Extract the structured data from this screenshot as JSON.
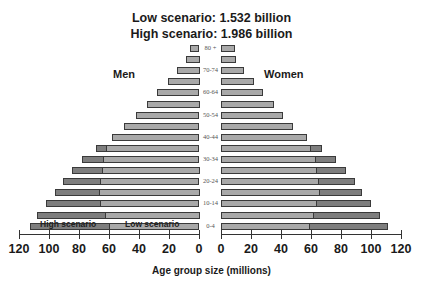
{
  "chart_data": {
    "type": "bar",
    "subtype": "population-pyramid",
    "title": "Low scenario: 1.532 billion",
    "subtitle": "High scenario: 1.986 billion",
    "xlabel": "Age group size (millions)",
    "ylabel": "",
    "left_label": "Men",
    "right_label": "Women",
    "legend": [
      "High scenario",
      "Low scenario"
    ],
    "xlim": [
      0,
      120
    ],
    "x_ticks": [
      0,
      20,
      40,
      60,
      80,
      100,
      120
    ],
    "grid": false,
    "categories": [
      "80 +",
      "75-79",
      "70-74",
      "65-69",
      "60-64",
      "55-59",
      "50-54",
      "45-49",
      "40-44",
      "35-39",
      "30-34",
      "25-29",
      "20-24",
      "15-19",
      "10-14",
      "5-9",
      "0-4"
    ],
    "category_labels_visible": [
      "80 +",
      "",
      "70-74",
      "",
      "60-64",
      "",
      "50-54",
      "",
      "40-44",
      "",
      "30-34",
      "",
      "20-24",
      "",
      "10-14",
      "",
      "0-4"
    ],
    "series": [
      {
        "name": "Men - Low scenario",
        "values": [
          6,
          9,
          15,
          21,
          28,
          35,
          42,
          50,
          58,
          62,
          64,
          65,
          66,
          67,
          66,
          63,
          60
        ]
      },
      {
        "name": "Men - High scenario",
        "values": [
          6,
          9,
          15,
          21,
          28,
          35,
          42,
          50,
          58,
          69,
          78,
          85,
          91,
          96,
          102,
          108,
          113
        ]
      },
      {
        "name": "Women - Low scenario",
        "values": [
          9,
          10,
          15,
          22,
          28,
          35,
          41,
          48,
          57,
          60,
          63,
          64,
          65,
          66,
          64,
          62,
          59
        ]
      },
      {
        "name": "Women - High scenario",
        "values": [
          9,
          10,
          15,
          22,
          28,
          35,
          41,
          48,
          57,
          67,
          76,
          83,
          89,
          94,
          100,
          106,
          111
        ]
      }
    ]
  },
  "labels": {
    "title_low": "Low scenario: 1.532 billion",
    "title_high": "High scenario: 1.986 billion",
    "men": "Men",
    "women": "Women",
    "xlabel": "Age group size (millions)",
    "legend_high": "High scenario",
    "legend_low": "Low scenario"
  },
  "colors": {
    "high": "#7e7e7e",
    "low": "#a9a9a9",
    "border": "#3a3a3a"
  }
}
